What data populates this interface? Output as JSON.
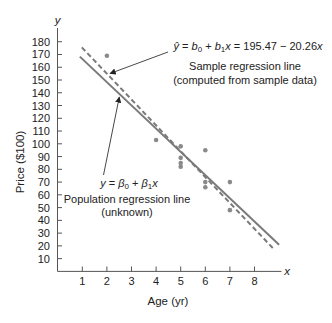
{
  "colors": {
    "axis": "#555555",
    "text": "#222222",
    "regression_line": "#7a7a7a",
    "points": "#8a8a8a",
    "arrow": "#333333"
  },
  "chart_data": {
    "type": "scatter",
    "title": "",
    "xlabel": "Age (yr)",
    "ylabel": "Price ($100)",
    "x_axis_symbol": "x",
    "y_axis_symbol": "y",
    "xlim": [
      0,
      9
    ],
    "ylim": [
      0,
      185
    ],
    "grid": false,
    "legend": "none",
    "xticks": [
      1,
      2,
      3,
      4,
      5,
      6,
      7,
      8
    ],
    "yticks": [
      10,
      20,
      30,
      40,
      50,
      60,
      70,
      80,
      90,
      100,
      110,
      120,
      130,
      140,
      150,
      160,
      170,
      180
    ],
    "points": {
      "x": [
        5,
        4,
        6,
        5,
        5,
        5,
        6,
        6,
        2,
        7,
        7
      ],
      "y": [
        85,
        103,
        70,
        82,
        89,
        98,
        66,
        95,
        169,
        70,
        48
      ]
    },
    "lines": [
      {
        "name": "Sample regression line",
        "style": "dashed",
        "intercept": 195.47,
        "slope": -20.26,
        "x_range": [
          0.98,
          8.76
        ]
      },
      {
        "name": "Population regression line",
        "style": "solid",
        "intercept": 184.7,
        "slope": -18.2,
        "x_range": [
          0.9,
          9.0
        ]
      }
    ],
    "annotations": {
      "sample": {
        "equation": {
          "yhat": "ŷ",
          "eq1": " = ",
          "b0": "b",
          "b0_sub": "0",
          "plus": " + ",
          "b1": "b",
          "b1_sub": "1",
          "x1": "x",
          "rest": " = 195.47 − 20.26",
          "x2": "x"
        },
        "line1": "Sample regression line",
        "line2": "(computed from sample data)"
      },
      "population": {
        "equation": {
          "y": "y",
          "eq1": " = ",
          "beta0": "β",
          "beta0_sub": "0",
          "plus": " + ",
          "beta1": "β",
          "beta1_sub": "1",
          "x": "x"
        },
        "line1": "Population regression line",
        "line2": "(unknown)"
      }
    }
  }
}
